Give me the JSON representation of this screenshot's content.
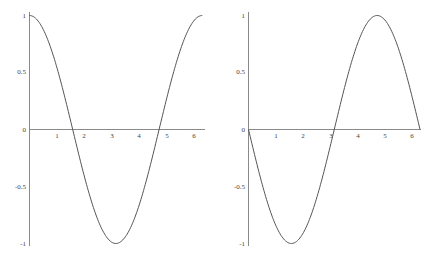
{
  "chart_data": [
    {
      "type": "line",
      "title": "",
      "xlabel": "",
      "ylabel": "",
      "function": "cos(x)",
      "xlim": [
        0,
        6.2832
      ],
      "ylim": [
        -1,
        1
      ],
      "grid": false,
      "x_ticks": [
        "1",
        "2",
        "3",
        "4",
        "5",
        "6"
      ],
      "y_ticks": [
        "1",
        "0.5",
        "0",
        "-0.5",
        "-1"
      ],
      "series": [
        {
          "name": "cos(x)",
          "x": [
            0,
            0.5,
            1,
            1.5708,
            2,
            2.5,
            3,
            3.1416,
            3.5,
            4,
            4.5,
            4.7124,
            5,
            5.5,
            6,
            6.2832
          ],
          "values": [
            1,
            0.878,
            0.54,
            0,
            -0.416,
            -0.801,
            -0.99,
            -1,
            -0.936,
            -0.654,
            -0.211,
            0,
            0.284,
            0.709,
            0.96,
            1
          ]
        }
      ],
      "color": "#555555"
    },
    {
      "type": "line",
      "title": "",
      "xlabel": "",
      "ylabel": "",
      "function": "-sin(x)",
      "xlim": [
        0,
        6.2832
      ],
      "ylim": [
        -1,
        1
      ],
      "grid": false,
      "x_ticks": [
        "1",
        "2",
        "3",
        "4",
        "5",
        "6"
      ],
      "y_ticks": [
        "1",
        "0.5",
        "0",
        "-0.5",
        "-1"
      ],
      "series": [
        {
          "name": "-sin(x)",
          "x": [
            0,
            0.5,
            1,
            1.5708,
            2,
            2.5,
            3,
            3.1416,
            3.5,
            4,
            4.5,
            4.7124,
            5,
            5.5,
            6,
            6.2832
          ],
          "values": [
            0,
            -0.479,
            -0.841,
            -1,
            -0.909,
            -0.598,
            -0.141,
            0,
            0.351,
            0.757,
            0.978,
            1,
            0.959,
            0.706,
            0.279,
            0
          ]
        }
      ],
      "color": "#555555"
    }
  ],
  "labels": {
    "x_ticks": [
      "1",
      "2",
      "3",
      "4",
      "5",
      "6"
    ],
    "y_ticks": [
      "1",
      "0.5",
      "0",
      "-0.5",
      "-1"
    ]
  }
}
